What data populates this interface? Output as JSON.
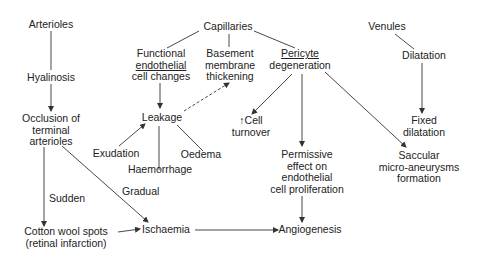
{
  "diagram": {
    "nodes": {
      "arterioles": "Arterioles",
      "hyalinosis": "Hyalinosis",
      "occlusion": [
        "Occlusion of",
        "terminal",
        "arterioles"
      ],
      "capillaries": "Capillaries",
      "functional": [
        "Functional",
        "endothelial",
        "cell changes"
      ],
      "basement": [
        "Basement",
        "membrane",
        "thickening"
      ],
      "pericyte": [
        "Pericyte",
        "degeneration"
      ],
      "venules": "Venules",
      "dilatation": "Dilatation",
      "fixed_dilatation": [
        "Fixed",
        "dilatation"
      ],
      "leakage": "Leakage",
      "exudation": "Exudation",
      "haemorrhage": "Haemorrhage",
      "oedema": "Oedema",
      "cell_turnover": [
        "↑Cell",
        "turnover"
      ],
      "permissive": [
        "Permissive",
        "effect on",
        "endothelial",
        "cell proliferation"
      ],
      "saccular": [
        "Saccular",
        "micro-aneurysms",
        "formation"
      ],
      "cotton_wool": [
        "Cotton wool spots",
        "(retinal infarction)"
      ],
      "ischaemia": "Ischaemia",
      "angiogenesis": "Angiogenesis"
    },
    "edge_labels": {
      "sudden": "Sudden",
      "gradual": "Gradual"
    },
    "line_color": "#333333"
  }
}
